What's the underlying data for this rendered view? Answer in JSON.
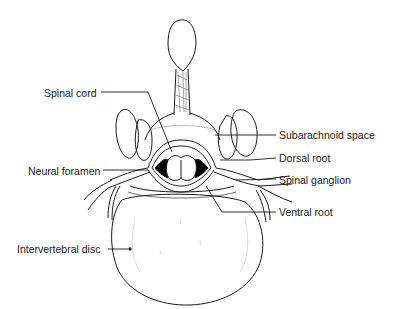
{
  "diagram": {
    "labels": [
      {
        "id": "spinal-cord",
        "text": "Spinal cord",
        "x": 44,
        "y": 87
      },
      {
        "id": "subarachnoid-space",
        "text": "Subarachnoid space",
        "x": 279,
        "y": 130
      },
      {
        "id": "dorsal-root",
        "text": "Dorsal root",
        "x": 279,
        "y": 153
      },
      {
        "id": "neural-foramen",
        "text": "Neural foramen",
        "x": 28,
        "y": 166
      },
      {
        "id": "spinal-ganglion",
        "text": "Spinal ganglion",
        "x": 279,
        "y": 174
      },
      {
        "id": "ventral-root",
        "text": "Ventral root",
        "x": 279,
        "y": 207
      },
      {
        "id": "intervertebral-disc",
        "text": "Intervertebral disc",
        "x": 17,
        "y": 244
      }
    ],
    "colors": {
      "line": "#1a1a1a",
      "background": "#ffffff",
      "fill": "#000000"
    }
  }
}
